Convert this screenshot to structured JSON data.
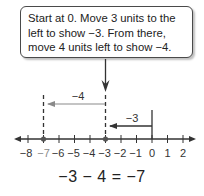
{
  "callout": {
    "lines": [
      "Start at 0. Move 3 units to the",
      "left to show −3. From there,",
      "move 4 units left to show −4."
    ]
  },
  "number_line": {
    "ticks": [
      "−8",
      "−7",
      "−6",
      "−5",
      "−4",
      "−3",
      "−2",
      "−1",
      "0",
      "1",
      "2"
    ],
    "highlighted_tick": "−7",
    "highlight_color": "#8a8a8a",
    "points": [
      "−7",
      "−3"
    ],
    "arrows": [
      {
        "label": "−3",
        "from": "0",
        "to": "−3"
      },
      {
        "label": "−4",
        "from": "−3",
        "to": "−7"
      }
    ]
  },
  "equation": "−3 − 4 = −7"
}
